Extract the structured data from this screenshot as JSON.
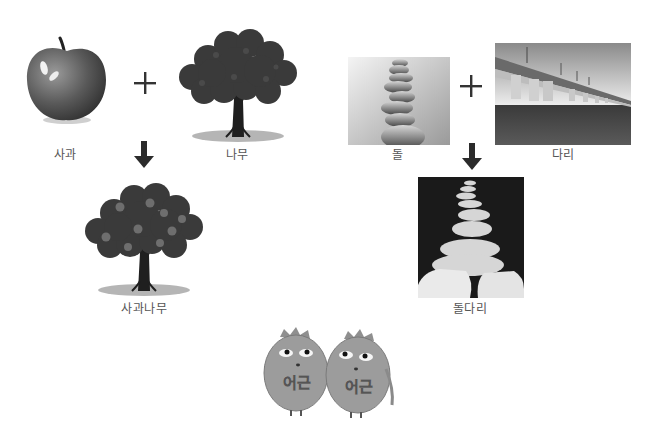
{
  "diagram": {
    "topic": "compound word formation",
    "colors": {
      "background": "#ffffff",
      "label_text": "#555555",
      "operator": "#333333",
      "arrow": "#333333"
    },
    "equations": [
      {
        "left": {
          "label": "사과",
          "icon": "apple-icon"
        },
        "operator": "+",
        "right": {
          "label": "나무",
          "icon": "tree-icon"
        },
        "result": {
          "label": "사과나무",
          "icon": "apple-tree-icon"
        }
      },
      {
        "left": {
          "label": "돌",
          "icon": "stacked-stones-photo"
        },
        "operator": "+",
        "right": {
          "label": "다리",
          "icon": "bridge-photo"
        },
        "result": {
          "label": "돌다리",
          "icon": "stepping-stones-photo"
        }
      }
    ],
    "characters": [
      {
        "text": "어근",
        "icon": "root-character-icon"
      },
      {
        "text": "어근",
        "icon": "root-character-icon"
      }
    ]
  }
}
